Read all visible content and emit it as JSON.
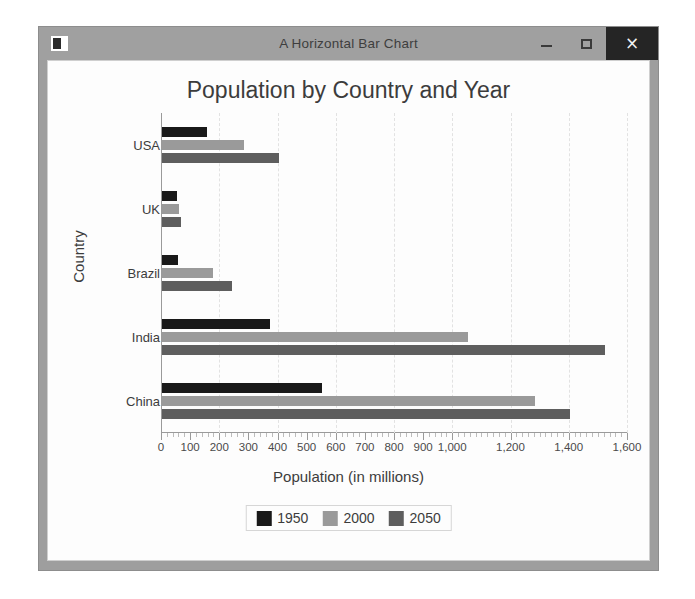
{
  "window": {
    "title": "A Horizontal Bar Chart",
    "icon": "app-icon",
    "controls": {
      "minimize": "–",
      "maximize": "□",
      "close": "×"
    }
  },
  "chart_data": {
    "type": "bar",
    "orientation": "horizontal",
    "title": "Population by Country and Year",
    "xlabel": "Population (in millions)",
    "ylabel": "Country",
    "categories": [
      "China",
      "India",
      "Brazil",
      "UK",
      "USA"
    ],
    "series": [
      {
        "name": "1950",
        "color": "#191919",
        "values": [
          550,
          370,
          55,
          50,
          155
        ]
      },
      {
        "name": "2000",
        "color": "#9a9a9a",
        "values": [
          1280,
          1050,
          175,
          59,
          280
        ]
      },
      {
        "name": "2050",
        "color": "#5e5e5e",
        "values": [
          1400,
          1520,
          240,
          65,
          400
        ]
      }
    ],
    "xlim": [
      0,
      1600
    ],
    "xticks": [
      0,
      100,
      200,
      300,
      400,
      500,
      600,
      700,
      800,
      900,
      1000,
      1200,
      1400,
      1600
    ],
    "xtick_labels": [
      "0",
      "100",
      "200",
      "300",
      "400",
      "500",
      "600",
      "700",
      "800",
      "900",
      "1,000",
      "1,200",
      "1,400",
      "1,600"
    ],
    "gridlines": [
      200,
      400,
      600,
      800,
      1000,
      1200,
      1400,
      1600
    ],
    "grid": true,
    "legend_position": "bottom"
  }
}
